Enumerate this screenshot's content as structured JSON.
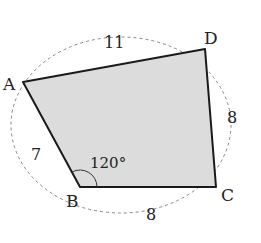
{
  "diagram": {
    "fill_color": "#dcdcdc",
    "edge_color": "#1a1a1a",
    "circle_color": "#888888",
    "vertices": [
      {
        "name": "A",
        "x": 23,
        "y": 82,
        "label_x": 3,
        "label_y": 90
      },
      {
        "name": "B",
        "x": 80,
        "y": 187,
        "label_x": 66,
        "label_y": 207
      },
      {
        "name": "C",
        "x": 216,
        "y": 187,
        "label_x": 221,
        "label_y": 201
      },
      {
        "name": "D",
        "x": 205,
        "y": 49,
        "label_x": 204,
        "label_y": 44
      }
    ],
    "side_labels": [
      {
        "side": "AD",
        "text": "11",
        "x": 113,
        "y": 48
      },
      {
        "side": "DC",
        "text": "8",
        "x": 233,
        "y": 123
      },
      {
        "side": "AB",
        "text": "7",
        "x": 36,
        "y": 160
      },
      {
        "side": "BC",
        "text": "8",
        "x": 151,
        "y": 218
      }
    ],
    "angle_label": {
      "vertex": "B",
      "text": "120°",
      "x": 90,
      "y": 168
    }
  }
}
